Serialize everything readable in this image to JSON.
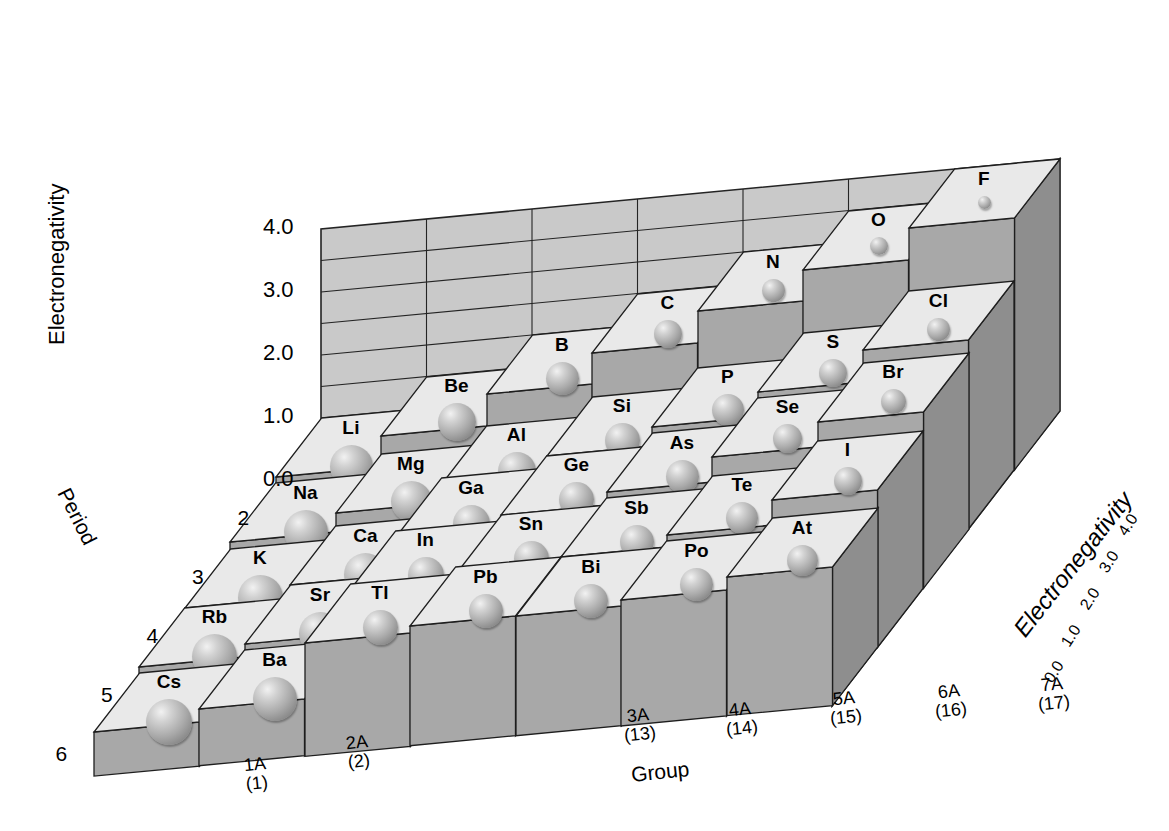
{
  "figure": {
    "type": "3d-bar-periodic-table",
    "background": "#ffffff",
    "block_top_color": "#e9e9e9",
    "block_front_color": "#a8a8a8",
    "block_side_color": "#8e8e8e",
    "block_dark_color": "#6f6f6f",
    "grid_wall_color": "#c8c8c8",
    "gridline_color": "#1a1a1a"
  },
  "axes": {
    "vertical": {
      "label": "Electronegativity",
      "ticks": [
        "4.0",
        "3.0",
        "2.0",
        "1.0",
        "0.0"
      ],
      "range": [
        0.0,
        4.0
      ],
      "step": 0.5
    },
    "depth": {
      "label": "Period",
      "ticks": [
        "2",
        "3",
        "4",
        "5",
        "6"
      ]
    },
    "horizontal": {
      "label": "Group",
      "ticks": [
        {
          "old": "1A",
          "iupac": "(1)"
        },
        {
          "old": "2A",
          "iupac": "(2)"
        },
        {
          "old": "3A",
          "iupac": "(13)"
        },
        {
          "old": "4A",
          "iupac": "(14)"
        },
        {
          "old": "5A",
          "iupac": "(15)"
        },
        {
          "old": "6A",
          "iupac": "(16)"
        },
        {
          "old": "7A",
          "iupac": "(17)"
        }
      ]
    },
    "right_depth": {
      "label": "Electronegativity",
      "ticks": [
        "0.0",
        "1.0",
        "2.0",
        "3.0",
        "4.0"
      ]
    }
  },
  "chart_data": {
    "type": "bar",
    "xlabel": "Group",
    "ylabel": "Electronegativity",
    "zlabel": "Period",
    "ylim": [
      0.0,
      4.0
    ],
    "grid": true,
    "legend": "none",
    "categories_x": [
      "1A (1)",
      "2A (2)",
      "3A (13)",
      "4A (14)",
      "5A (15)",
      "6A (16)",
      "7A (17)"
    ],
    "categories_z": [
      "2",
      "3",
      "4",
      "5",
      "6"
    ],
    "note": "Bar height = electronegativity; sphere size = relative atomic radius (larger sphere = lower electronegativity).",
    "points": [
      {
        "symbol": "Li",
        "group": "1A",
        "period": 2,
        "value": 1.0
      },
      {
        "symbol": "Be",
        "group": "2A",
        "period": 2,
        "value": 1.5
      },
      {
        "symbol": "B",
        "group": "3A",
        "period": 2,
        "value": 2.0
      },
      {
        "symbol": "C",
        "group": "4A",
        "period": 2,
        "value": 2.5
      },
      {
        "symbol": "N",
        "group": "5A",
        "period": 2,
        "value": 3.0
      },
      {
        "symbol": "O",
        "group": "6A",
        "period": 2,
        "value": 3.5
      },
      {
        "symbol": "F",
        "group": "7A",
        "period": 2,
        "value": 4.0
      },
      {
        "symbol": "Na",
        "group": "1A",
        "period": 3,
        "value": 0.9
      },
      {
        "symbol": "Mg",
        "group": "2A",
        "period": 3,
        "value": 1.2
      },
      {
        "symbol": "Al",
        "group": "3A",
        "period": 3,
        "value": 1.5
      },
      {
        "symbol": "Si",
        "group": "4A",
        "period": 3,
        "value": 1.8
      },
      {
        "symbol": "P",
        "group": "5A",
        "period": 3,
        "value": 2.1
      },
      {
        "symbol": "S",
        "group": "6A",
        "period": 3,
        "value": 2.5
      },
      {
        "symbol": "Cl",
        "group": "7A",
        "period": 3,
        "value": 3.0
      },
      {
        "symbol": "K",
        "group": "1A",
        "period": 4,
        "value": 0.8
      },
      {
        "symbol": "Ca",
        "group": "2A",
        "period": 4,
        "value": 1.0
      },
      {
        "symbol": "Ga",
        "group": "3A",
        "period": 4,
        "value": 1.6
      },
      {
        "symbol": "Ge",
        "group": "4A",
        "period": 4,
        "value": 1.8
      },
      {
        "symbol": "As",
        "group": "5A",
        "period": 4,
        "value": 2.0
      },
      {
        "symbol": "Se",
        "group": "6A",
        "period": 4,
        "value": 2.4
      },
      {
        "symbol": "Br",
        "group": "7A",
        "period": 4,
        "value": 2.8
      },
      {
        "symbol": "Rb",
        "group": "1A",
        "period": 5,
        "value": 0.8
      },
      {
        "symbol": "Sr",
        "group": "2A",
        "period": 5,
        "value": 1.0
      },
      {
        "symbol": "In",
        "group": "3A",
        "period": 5,
        "value": 1.7
      },
      {
        "symbol": "Sn",
        "group": "4A",
        "period": 5,
        "value": 1.8
      },
      {
        "symbol": "Sb",
        "group": "5A",
        "period": 5,
        "value": 1.9
      },
      {
        "symbol": "Te",
        "group": "6A",
        "period": 5,
        "value": 2.1
      },
      {
        "symbol": "I",
        "group": "7A",
        "period": 5,
        "value": 2.5
      },
      {
        "symbol": "Cs",
        "group": "1A",
        "period": 6,
        "value": 0.7
      },
      {
        "symbol": "Ba",
        "group": "2A",
        "period": 6,
        "value": 0.9
      },
      {
        "symbol": "Tl",
        "group": "3A",
        "period": 6,
        "value": 1.8
      },
      {
        "symbol": "Pb",
        "group": "4A",
        "period": 6,
        "value": 1.9
      },
      {
        "symbol": "Bi",
        "group": "5A",
        "period": 6,
        "value": 1.9
      },
      {
        "symbol": "Po",
        "group": "6A",
        "period": 6,
        "value": 2.0
      },
      {
        "symbol": "At",
        "group": "7A",
        "period": 6,
        "value": 2.2
      }
    ]
  },
  "elements": {
    "Li": "Li",
    "Be": "Be",
    "B": "B",
    "C": "C",
    "N": "N",
    "O": "O",
    "F": "F",
    "Na": "Na",
    "Mg": "Mg",
    "Al": "Al",
    "Si": "Si",
    "P": "P",
    "S": "S",
    "Cl": "Cl",
    "K": "K",
    "Ca": "Ca",
    "Ga": "Ga",
    "Ge": "Ge",
    "As": "As",
    "Se": "Se",
    "Br": "Br",
    "Rb": "Rb",
    "Sr": "Sr",
    "In": "In",
    "Sn": "Sn",
    "Sb": "Sb",
    "Te": "Te",
    "I": "I",
    "Cs": "Cs",
    "Ba": "Ba",
    "Tl": "Tl",
    "Pb": "Pb",
    "Bi": "Bi",
    "Po": "Po",
    "At": "At"
  }
}
